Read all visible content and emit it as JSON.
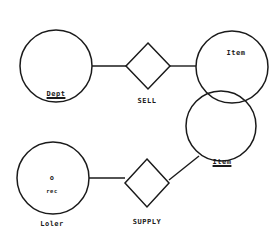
{
  "diagram": {
    "type": "entity-relationship",
    "stroke_color": "#1a1a1a",
    "background": "#ffffff",
    "entities": [
      {
        "id": "dept",
        "label": "Dept",
        "underlined": true,
        "cx": 56,
        "cy": 66,
        "r": 36,
        "label_x": 56,
        "label_y": 91
      },
      {
        "id": "item_top",
        "label": "Item",
        "underlined": false,
        "cx": 232,
        "cy": 67,
        "r": 36,
        "label_x": 236,
        "label_y": 50
      },
      {
        "id": "item_bottom",
        "label": "Item",
        "underlined": true,
        "cx": 221,
        "cy": 126,
        "r": 35,
        "label_x": 222,
        "label_y": 159
      },
      {
        "id": "color",
        "label": "Loler",
        "underlined": false,
        "cx": 53,
        "cy": 178,
        "r": 36,
        "label_x": 52,
        "label_y": 221,
        "attribute": {
          "symbol": "o",
          "label": "rec",
          "x": 52,
          "y": 180,
          "label_y": 193
        }
      }
    ],
    "relationships": [
      {
        "id": "sell",
        "label": "SELL",
        "cx": 148,
        "cy": 66,
        "half_w": 22,
        "half_h": 23,
        "label_x": 147,
        "label_y": 98
      },
      {
        "id": "supply",
        "label": "SUPPLY",
        "cx": 147,
        "cy": 183,
        "half_w": 22,
        "half_h": 24,
        "label_x": 147,
        "label_y": 219
      }
    ],
    "connections": [
      {
        "from": "dept",
        "to": "sell",
        "x1": 92,
        "y1": 66,
        "x2": 126,
        "y2": 66
      },
      {
        "from": "sell",
        "to": "item_top",
        "x1": 170,
        "y1": 66,
        "x2": 196,
        "y2": 66
      },
      {
        "from": "color",
        "to": "supply",
        "x1": 89,
        "y1": 178,
        "x2": 125,
        "y2": 178
      },
      {
        "from": "supply",
        "to": "item_bottom",
        "x1": 169,
        "y1": 180,
        "x2": 199,
        "y2": 156
      }
    ]
  }
}
